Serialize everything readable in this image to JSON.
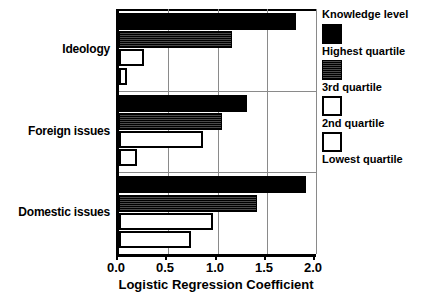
{
  "chart_data": {
    "type": "bar",
    "orientation": "horizontal",
    "title": "",
    "xlabel": "Logistic Regression Coefficient",
    "ylabel": "",
    "xlim": [
      0.0,
      2.0
    ],
    "xticks": [
      0.0,
      0.5,
      1.0,
      1.5,
      2.0
    ],
    "xticklabels": [
      "0.0",
      "0.5",
      "1.0",
      "1.5",
      "2.0"
    ],
    "grid": true,
    "grid_axis": "x",
    "legend_position": "right",
    "legend_title": "Knowledge level",
    "categories": [
      "Ideology",
      "Foreign issues",
      "Domestic issues"
    ],
    "series": [
      {
        "name": "Highest quartile",
        "style": "solid-black",
        "color": "#000000",
        "values": [
          1.8,
          1.3,
          1.9
        ]
      },
      {
        "name": "3rd quartile",
        "style": "dark-hatched",
        "color": "#1a1a1a",
        "values": [
          1.15,
          1.05,
          1.4
        ]
      },
      {
        "name": "2nd quartile",
        "style": "open-white",
        "color": "#ffffff",
        "values": [
          0.25,
          0.85,
          0.95
        ]
      },
      {
        "name": "Lowest quartile",
        "style": "open-white",
        "color": "#ffffff",
        "values": [
          0.08,
          0.18,
          0.73
        ]
      }
    ]
  },
  "axis": {
    "x_title": "Logistic Regression Coefficient",
    "ticklabels": [
      "0.0",
      "0.5",
      "1.0",
      "1.5",
      "2.0"
    ]
  },
  "categories": {
    "c0": "Ideology",
    "c1": "Foreign issues",
    "c2": "Domestic issues"
  },
  "legend": {
    "title": "Knowledge level",
    "items": [
      {
        "label": "Highest quartile"
      },
      {
        "label": "3rd quartile"
      },
      {
        "label": "2nd quartile"
      },
      {
        "label": "Lowest quartile"
      }
    ]
  }
}
